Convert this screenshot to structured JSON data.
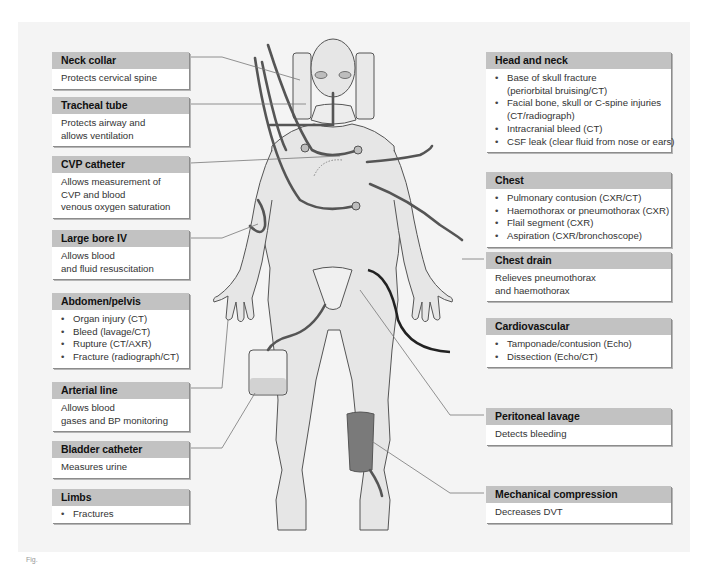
{
  "diagram": {
    "colors": {
      "panel_bg": "#f4f4f4",
      "header_band": "#c2c2c2",
      "box_bg": "#ffffff",
      "skin": "#e6e6e6",
      "outline": "#555555",
      "compression_sleeve": "#7a7a7a",
      "arterial_line": "#222222"
    }
  },
  "left_boxes": [
    {
      "title": "Neck collar",
      "lines": [
        "Protects cervical spine"
      ]
    },
    {
      "title": "Tracheal tube",
      "lines": [
        "Protects airway and",
        "allows ventilation"
      ]
    },
    {
      "title": "CVP catheter",
      "lines": [
        "Allows measurement of",
        "CVP and blood",
        "venous oxygen saturation"
      ]
    },
    {
      "title": "Large bore IV",
      "lines": [
        "Allows blood",
        "and fluid resuscitation"
      ]
    },
    {
      "title": "Abdomen/pelvis",
      "bullets": [
        "Organ injury (CT)",
        "Bleed (lavage/CT)",
        "Rupture (CT/AXR)",
        "Fracture (radiograph/CT)"
      ]
    },
    {
      "title": "Arterial line",
      "lines": [
        "Allows blood",
        "gases and BP monitoring"
      ]
    },
    {
      "title": "Bladder catheter",
      "lines": [
        "Measures urine"
      ]
    },
    {
      "title": "Limbs",
      "bullets": [
        "Fractures"
      ]
    }
  ],
  "right_boxes": [
    {
      "title": "Head and neck",
      "bullets": [
        "Base of skull fracture\n(periorbital bruising/CT)",
        "Facial bone, skull or C-spine injuries\n(CT/radiograph)",
        "Intracranial bleed (CT)",
        "CSF leak (clear fluid from nose or ears)"
      ]
    },
    {
      "title": "Chest",
      "bullets": [
        "Pulmonary contusion (CXR/CT)",
        "Haemothorax or pneumothorax (CXR)",
        "Flail segment (CXR)",
        "Aspiration (CXR/bronchoscope)"
      ]
    },
    {
      "title": "Chest drain",
      "lines": [
        "Relieves pneumothorax",
        "and haemothorax"
      ]
    },
    {
      "title": "Cardiovascular",
      "bullets": [
        "Tamponade/contusion (Echo)",
        "Dissection (Echo/CT)"
      ]
    },
    {
      "title": "Peritoneal lavage",
      "lines": [
        "Detects bleeding"
      ]
    },
    {
      "title": "Mechanical compression",
      "lines": [
        "Decreases DVT"
      ]
    }
  ],
  "figure_label": "Fig."
}
